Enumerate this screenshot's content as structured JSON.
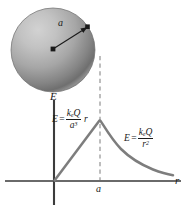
{
  "figure": {
    "type": "physics-diagram"
  },
  "sphere": {
    "name": "uniformly-charged-sphere",
    "radius_label": "a",
    "center_dot": "center-point",
    "surface_dot": "surface-point",
    "fill_light": "#c9c9c9",
    "fill_dark": "#6e6e6e",
    "outline": "#5a5a5a"
  },
  "axes": {
    "y_label": "E",
    "x_label": "r",
    "tick_label": "a",
    "axis_color": "#5f5f5f"
  },
  "curve": {
    "color": "#7d7d7d",
    "peak_label": "a",
    "inside_region": "linear rise proportional to r",
    "outside_region": "inverse square decay"
  },
  "formulas": {
    "inside": {
      "lhs": "E",
      "equals": "=",
      "numerator": "k",
      "numerator_sub": "e",
      "numerator_q": "Q",
      "denominator": "a",
      "denominator_exp": "3",
      "trailing": "r",
      "plain": "E = keQ/a^3 r"
    },
    "outside": {
      "lhs": "E",
      "equals": "=",
      "numerator": "k",
      "numerator_sub": "e",
      "numerator_q": "Q",
      "denominator": "r",
      "denominator_exp": "2",
      "plain": "E = keQ/r^2"
    }
  },
  "dashed_line": {
    "name": "radius-guide-line",
    "color": "#8a8a8a"
  }
}
